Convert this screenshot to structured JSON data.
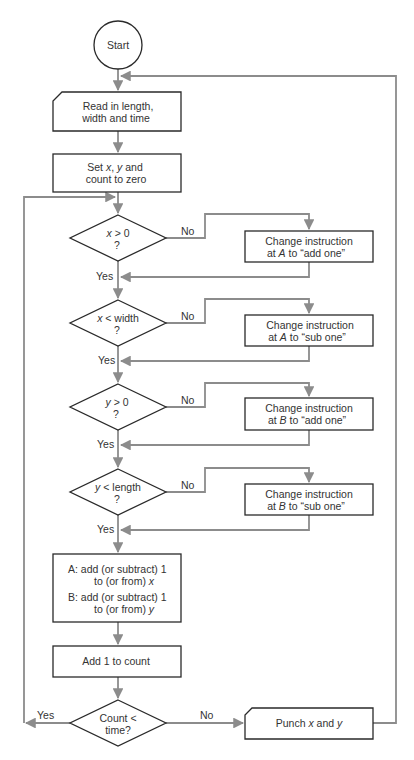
{
  "diagram": {
    "type": "flowchart",
    "colors": {
      "shape_stroke": "#2a2a2a",
      "flow_line": "#8c8c8c",
      "text": "#333333",
      "background": "#ffffff"
    },
    "start": {
      "label": "Start"
    },
    "read_input": {
      "line1": "Read in length,",
      "line2": "width and time"
    },
    "init": {
      "line1_pre": "Set ",
      "line1_x": "x",
      "line1_mid": ", ",
      "line1_y": "y",
      "line1_post": " and",
      "line2": "count to zero"
    },
    "decisions": [
      {
        "var": "x",
        "op": " > 0",
        "q": "?",
        "no_label": "No",
        "yes_label": "Yes",
        "action": {
          "line1": "Change instruction",
          "line2_pre": "at ",
          "line2_var": "A",
          "line2_post": " to “add one”"
        }
      },
      {
        "var": "x",
        "op": " < width",
        "q": "?",
        "no_label": "No",
        "yes_label": "Yes",
        "action": {
          "line1": "Change instruction",
          "line2_pre": "at ",
          "line2_var": "A",
          "line2_post": " to “sub one”"
        }
      },
      {
        "var": "y",
        "op": " > 0",
        "q": "?",
        "no_label": "No",
        "yes_label": "Yes",
        "action": {
          "line1": "Change instruction",
          "line2_pre": "at ",
          "line2_var": "B",
          "line2_post": " to “add one”"
        }
      },
      {
        "var": "y",
        "op": " < length",
        "q": "?",
        "no_label": "No",
        "yes_label": "Yes",
        "action": {
          "line1": "Change instruction",
          "line2_pre": "at ",
          "line2_var": "B",
          "line2_post": " to “sub one”"
        }
      }
    ],
    "update": {
      "a_line1": "A:  add (or subtract) 1",
      "a_line2": "to (or from) ",
      "a_var": "x",
      "b_line1": "B:  add (or subtract) 1",
      "b_line2": "to (or from) ",
      "b_var": "y"
    },
    "counter": {
      "label": "Add 1 to count"
    },
    "loop_check": {
      "line1": "Count <",
      "line2": "time?",
      "yes_label": "Yes",
      "no_label": "No"
    },
    "output": {
      "pre": "Punch ",
      "x": "x",
      "mid": " and ",
      "y": "y"
    }
  }
}
